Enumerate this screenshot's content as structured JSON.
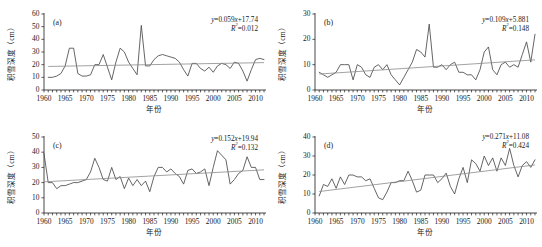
{
  "figure": {
    "axis": {
      "xlabel": "年份",
      "ylabel": "积雪深度（cm）",
      "xticks": [
        "1960",
        "1965",
        "1970",
        "1975",
        "1980",
        "1985",
        "1990",
        "1995",
        "2000",
        "2005",
        "2010"
      ],
      "xlim": [
        1960,
        2012
      ],
      "minor_tick_interval": 1
    },
    "colors": {
      "series": "#4a4a4a",
      "trend": "#8a8a8a",
      "axis": "#1a1a1a",
      "background": "#ffffff"
    }
  },
  "chart_data": [
    {
      "type": "line",
      "panel": "(a)",
      "title": "",
      "xlabel": "年份",
      "ylabel": "积雪深度（cm）",
      "xlim": [
        1960,
        2012
      ],
      "ylim": [
        0,
        60
      ],
      "yticks": [
        0,
        10,
        20,
        30,
        40,
        50,
        60
      ],
      "grid": false,
      "annotations": {
        "equation": "y=0.059x+17.74",
        "r_squared": "R²=0.012",
        "slope": 0.059,
        "intercept": 17.74,
        "r2": 0.012
      },
      "series": [
        {
          "name": "积雪深度",
          "x": [
            1961,
            1962,
            1963,
            1964,
            1965,
            1966,
            1967,
            1968,
            1969,
            1970,
            1971,
            1972,
            1973,
            1974,
            1975,
            1976,
            1977,
            1978,
            1979,
            1980,
            1981,
            1982,
            1983,
            1984,
            1985,
            1986,
            1987,
            1988,
            1989,
            1990,
            1991,
            1992,
            1993,
            1994,
            1995,
            1996,
            1997,
            1998,
            1999,
            2000,
            2001,
            2002,
            2003,
            2004,
            2005,
            2006,
            2007,
            2008,
            2009,
            2010,
            2011,
            2012
          ],
          "values": [
            10,
            10,
            11,
            13,
            19,
            33,
            33,
            13,
            11,
            11,
            12,
            20,
            20,
            28,
            18,
            8,
            22,
            33,
            30,
            22,
            17,
            12,
            51,
            19,
            19,
            24,
            27,
            28,
            27,
            26,
            25,
            22,
            16,
            11,
            21,
            21,
            17,
            15,
            18,
            14,
            19,
            21,
            20,
            17,
            22,
            21,
            15,
            7,
            16,
            24,
            25,
            24
          ]
        },
        {
          "name": "趋势线",
          "x": [
            1961,
            2012
          ],
          "values": [
            18.6,
            21.6
          ]
        }
      ]
    },
    {
      "type": "line",
      "panel": "(b)",
      "title": "",
      "xlabel": "年份",
      "ylabel": "积雪深度（cm）",
      "xlim": [
        1960,
        2012
      ],
      "ylim": [
        0,
        30
      ],
      "yticks": [
        0,
        10,
        20,
        30
      ],
      "grid": false,
      "annotations": {
        "equation": "y=0.109x+5.881",
        "r_squared": "R²=0.148",
        "slope": 0.109,
        "intercept": 5.881,
        "r2": 0.148
      },
      "series": [
        {
          "name": "积雪深度",
          "x": [
            1961,
            1962,
            1963,
            1964,
            1965,
            1966,
            1967,
            1968,
            1969,
            1970,
            1971,
            1972,
            1973,
            1974,
            1975,
            1976,
            1977,
            1978,
            1979,
            1980,
            1981,
            1982,
            1983,
            1984,
            1985,
            1986,
            1987,
            1988,
            1989,
            1990,
            1991,
            1992,
            1993,
            1994,
            1995,
            1996,
            1997,
            1998,
            1999,
            2000,
            2001,
            2002,
            2003,
            2004,
            2005,
            2006,
            2007,
            2008,
            2009,
            2010,
            2011,
            2012
          ],
          "values": [
            7,
            6,
            5,
            6,
            7,
            10,
            10,
            10,
            4,
            10,
            9,
            6,
            5,
            9,
            10,
            8,
            10,
            6,
            4,
            2,
            5,
            8,
            11,
            16,
            15,
            13,
            26,
            9,
            9,
            10,
            8,
            10,
            11,
            7,
            7,
            6,
            6,
            4,
            8,
            15,
            17,
            8,
            6,
            10,
            11,
            9,
            10,
            9,
            14,
            19,
            11,
            22
          ]
        },
        {
          "name": "趋势线",
          "x": [
            1961,
            2012
          ],
          "values": [
            6.3,
            11.9
          ]
        }
      ]
    },
    {
      "type": "line",
      "panel": "(c)",
      "title": "",
      "xlabel": "年份",
      "ylabel": "积雪深度（cm）",
      "xlim": [
        1960,
        2012
      ],
      "ylim": [
        0,
        50
      ],
      "yticks": [
        0,
        10,
        20,
        30,
        40,
        50
      ],
      "grid": false,
      "annotations": {
        "equation": "y=0.152x+19.94",
        "r_squared": "R²=0.132",
        "slope": 0.152,
        "intercept": 19.94,
        "r2": 0.132
      },
      "series": [
        {
          "name": "积雪深度",
          "x": [
            1960,
            1961,
            1962,
            1963,
            1964,
            1965,
            1966,
            1967,
            1968,
            1969,
            1970,
            1971,
            1972,
            1973,
            1974,
            1975,
            1976,
            1977,
            1978,
            1979,
            1980,
            1981,
            1982,
            1983,
            1984,
            1985,
            1986,
            1987,
            1988,
            1989,
            1990,
            1991,
            1992,
            1993,
            1994,
            1995,
            1996,
            1997,
            1998,
            1999,
            2000,
            2001,
            2002,
            2003,
            2004,
            2005,
            2006,
            2007,
            2008,
            2009,
            2010,
            2011,
            2012
          ],
          "values": [
            39,
            20,
            20,
            16,
            18,
            18,
            19,
            20,
            20,
            21,
            22,
            27,
            36,
            30,
            22,
            21,
            30,
            22,
            24,
            16,
            23,
            18,
            22,
            18,
            21,
            14,
            24,
            30,
            30,
            27,
            29,
            26,
            24,
            19,
            28,
            29,
            26,
            27,
            29,
            18,
            30,
            41,
            38,
            35,
            19,
            22,
            26,
            28,
            37,
            30,
            30,
            22,
            22
          ]
        },
        {
          "name": "趋势线",
          "x": [
            1960,
            2012
          ],
          "values": [
            20.5,
            28.4
          ]
        }
      ]
    },
    {
      "type": "line",
      "panel": "(d)",
      "title": "",
      "xlabel": "年份",
      "ylabel": "积雪深度（cm）",
      "xlim": [
        1960,
        2012
      ],
      "ylim": [
        0,
        40
      ],
      "yticks": [
        0,
        10,
        20,
        30,
        40
      ],
      "grid": false,
      "annotations": {
        "equation": "y=0.271x+11.08",
        "r_squared": "R²=0.424",
        "slope": 0.271,
        "intercept": 11.08,
        "r2": 0.424
      },
      "series": [
        {
          "name": "积雪深度",
          "x": [
            1961,
            1962,
            1963,
            1964,
            1965,
            1966,
            1967,
            1968,
            1969,
            1970,
            1971,
            1972,
            1973,
            1974,
            1975,
            1976,
            1977,
            1978,
            1979,
            1980,
            1981,
            1982,
            1983,
            1984,
            1985,
            1986,
            1987,
            1988,
            1989,
            1990,
            1991,
            1992,
            1993,
            1994,
            1995,
            1996,
            1997,
            1998,
            1999,
            2000,
            2001,
            2002,
            2003,
            2004,
            2005,
            2006,
            2007,
            2008,
            2009,
            2010,
            2011,
            2012
          ],
          "values": [
            9,
            15,
            14,
            18,
            13,
            19,
            15,
            20,
            20,
            19,
            19,
            17,
            18,
            13,
            8,
            7,
            11,
            16,
            16,
            17,
            17,
            22,
            17,
            11,
            12,
            20,
            20,
            20,
            16,
            18,
            21,
            14,
            10,
            18,
            24,
            16,
            28,
            26,
            22,
            30,
            25,
            29,
            22,
            29,
            25,
            34,
            25,
            19,
            25,
            27,
            24,
            28
          ]
        },
        {
          "name": "趋势线",
          "x": [
            1961,
            2012
          ],
          "values": [
            11.3,
            25.3
          ]
        }
      ]
    }
  ]
}
